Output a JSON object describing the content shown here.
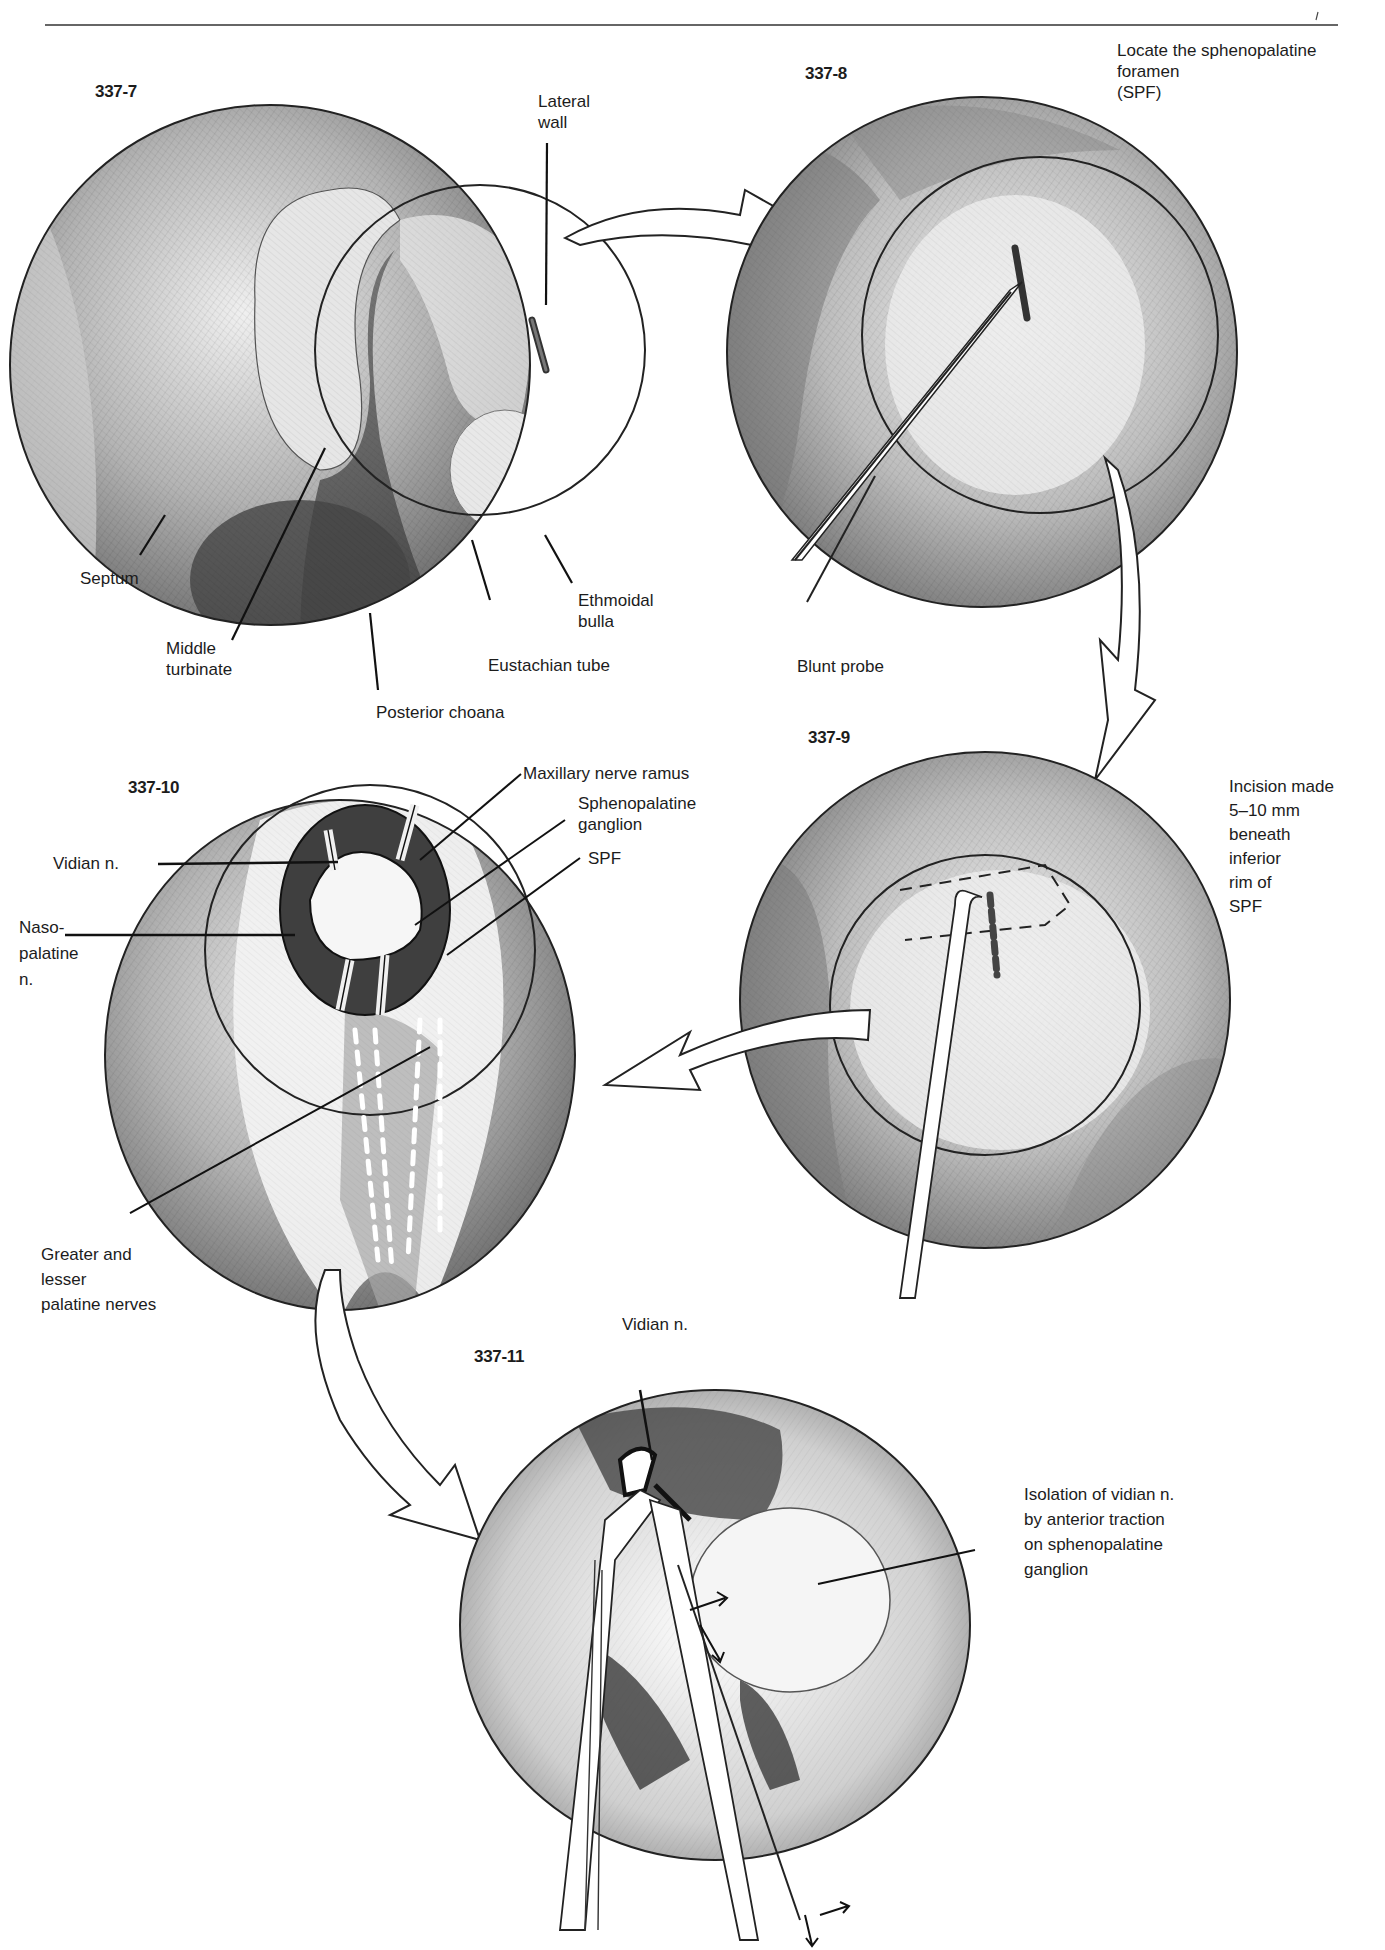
{
  "page": {
    "header_rule": true
  },
  "figures": [
    {
      "id": "337-7",
      "number": "337-7",
      "labels": {
        "lateral_wall": "Lateral\nwall",
        "septum": "Septum",
        "middle_turbinate": "Middle\nturbinate",
        "posterior_choana": "Posterior choana",
        "eustachian_tube": "Eustachian tube",
        "ethmoidal_bulla": "Ethmoidal\nbulla"
      }
    },
    {
      "id": "337-8",
      "number": "337-8",
      "caption": "Locate the sphenopalatine\nforamen\n(SPF)",
      "labels": {
        "blunt_probe": "Blunt probe"
      }
    },
    {
      "id": "337-9",
      "number": "337-9",
      "caption": "Incision made\n5–10 mm\nbeneath\ninferior\nrim of\nSPF"
    },
    {
      "id": "337-10",
      "number": "337-10",
      "labels": {
        "maxillary_nerve_ramus": "Maxillary nerve ramus",
        "sphenopalatine_ganglion": "Sphenopalatine\nganglion",
        "spf": "SPF",
        "vidian_n": "Vidian n.",
        "nasopalatine_n": "Naso-\npalatine\nn.",
        "greater_lesser_palatine": "Greater and\nlesser\npalatine nerves"
      }
    },
    {
      "id": "337-11",
      "number": "337-11",
      "caption": "Isolation of vidian n.\nby anterior traction\non sphenopalatine\nganglion",
      "labels": {
        "vidian_n": "Vidian n."
      }
    }
  ],
  "flow_arrows": [
    {
      "from": "337-7",
      "to": "337-8"
    },
    {
      "from": "337-8",
      "to": "337-9"
    },
    {
      "from": "337-9",
      "to": "337-10"
    },
    {
      "from": "337-10",
      "to": "337-11"
    }
  ],
  "colors": {
    "ink": "#1c1c1c",
    "tissue_light": "#d9d9d9",
    "tissue_mid": "#9a9a9a",
    "tissue_dark": "#4a4a4a",
    "paper": "#ffffff"
  }
}
